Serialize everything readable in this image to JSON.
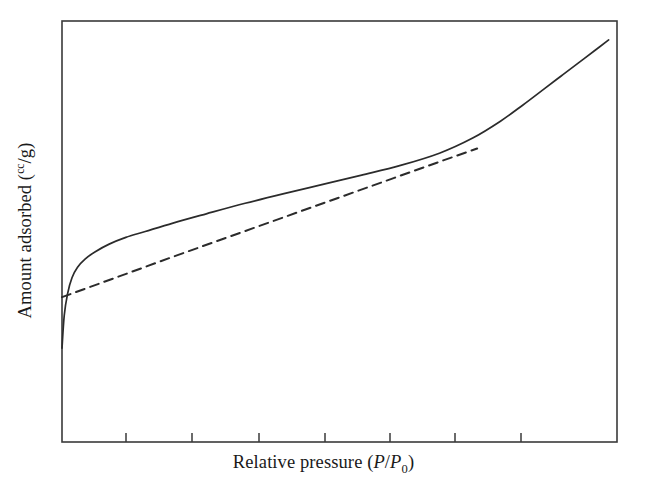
{
  "figure": {
    "background_color": "#ffffff",
    "ink_color": "#2b2b2b",
    "width": 647,
    "height": 497
  },
  "axes": {
    "frame": {
      "left": 62,
      "top": 21,
      "right": 617,
      "bottom": 442,
      "line_color": "#3a3a3a",
      "line_width": 1.6
    },
    "x_label_prefix": "Relative pressure (",
    "x_label_p1": "P",
    "x_label_slash": "/",
    "x_label_p2": "P",
    "x_label_sub": "0",
    "x_label_suffix": ")",
    "x_label_full": "Relative pressure (P/P0)",
    "y_label_prefix": "Amount adsorbed (",
    "y_label_sup": "cc",
    "y_label_mid": "/g",
    "y_label_suffix": ")",
    "y_label_full": "Amount adsorbed (cc/g)",
    "x_tick_positions": [
      126,
      192,
      259,
      325,
      390,
      455,
      521
    ],
    "x_tick_length": 9,
    "y_tick_positions": [],
    "x_tick_labels": [],
    "y_tick_labels": []
  },
  "chart_data": {
    "type": "line",
    "title": "",
    "subtitle": "",
    "xlabel": "Relative pressure (P/P0)",
    "ylabel": "Amount adsorbed (cc/g)",
    "xlim": [
      0,
      1
    ],
    "ylim": [
      0,
      1
    ],
    "grid": false,
    "legend": false,
    "legend_position": "none",
    "axis_tick_labels_shown": false,
    "series": [
      {
        "name": "Adsorption isotherm",
        "style": "solid",
        "color": "#2b2b2b",
        "line_width": 1.7,
        "x": [
          0.0,
          0.004,
          0.01,
          0.018,
          0.028,
          0.042,
          0.06,
          0.085,
          0.115,
          0.15,
          0.2,
          0.26,
          0.33,
          0.4,
          0.47,
          0.54,
          0.61,
          0.68,
          0.74,
          0.79,
          0.83,
          0.87,
          0.9,
          0.93,
          0.96,
          0.985
        ],
        "y": [
          0.223,
          0.3,
          0.352,
          0.39,
          0.415,
          0.435,
          0.452,
          0.47,
          0.486,
          0.5,
          0.52,
          0.542,
          0.567,
          0.59,
          0.612,
          0.634,
          0.657,
          0.686,
          0.722,
          0.762,
          0.8,
          0.84,
          0.87,
          0.9,
          0.93,
          0.955
        ]
      },
      {
        "name": "Reference tangent line",
        "style": "dashed",
        "color": "#2b2b2b",
        "line_width": 2.0,
        "dash_pattern": "9 6",
        "x": [
          0.0,
          0.1,
          0.2,
          0.3,
          0.4,
          0.5,
          0.6,
          0.7,
          0.748
        ],
        "y": [
          0.344,
          0.392,
          0.44,
          0.487,
          0.534,
          0.581,
          0.628,
          0.675,
          0.697
        ]
      }
    ],
    "annotations": [
      {
        "text": "crossing point",
        "x": 0.541,
        "y": 0.645,
        "visible": false
      }
    ]
  }
}
